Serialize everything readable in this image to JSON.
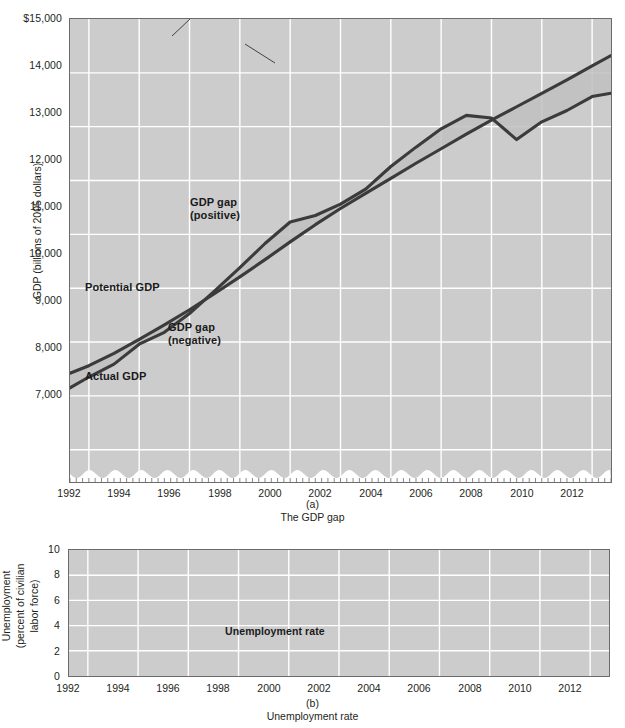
{
  "figure": {
    "panels": [
      {
        "id": "a",
        "caption_letter": "(a)",
        "caption_title": "The GDP gap"
      },
      {
        "id": "b",
        "caption_letter": "(b)",
        "caption_title": "Unemployment rate"
      }
    ]
  },
  "chart_data": [
    {
      "type": "area",
      "id": "panel-a",
      "title": "The GDP gap",
      "subtitle": "(a)",
      "xlabel": "",
      "ylabel": "GDP (billions of 2005 dollars)",
      "xlim": [
        1991.25,
        2012.75
      ],
      "ylim": [
        6400,
        15000
      ],
      "y_axis_break": true,
      "grid": true,
      "grid_color": "#ffffff",
      "plot_background": "#cccccc",
      "line_color": "#3b3b3b",
      "gap_fill_color": "#bfbfbf",
      "xticks": [
        1992,
        1994,
        1996,
        1998,
        2000,
        2002,
        2004,
        2006,
        2008,
        2010,
        2012
      ],
      "xtick_labels": [
        "1992",
        "1994",
        "1996",
        "1998",
        "2000",
        "2002",
        "2004",
        "2006",
        "2008",
        "2010",
        "2012"
      ],
      "yticks": [
        7000,
        8000,
        9000,
        10000,
        11000,
        12000,
        13000,
        14000,
        15000
      ],
      "ytick_labels": [
        "7,000",
        "8,000",
        "9,000",
        "10,000",
        "11,000",
        "12,000",
        "13,000",
        "14,000",
        "$15,000"
      ],
      "annotations": [
        {
          "text_line1": "GDP gap",
          "text_line2": "(positive)",
          "x": 1998.2,
          "y": 11600
        },
        {
          "text_line1": "Potential GDP",
          "text_line2": "",
          "x": 1992.6,
          "y": 9750
        },
        {
          "text_line1": "GDP gap",
          "text_line2": "(negative)",
          "x": 1995.4,
          "y": 9100
        },
        {
          "text_line1": "Actual GDP",
          "text_line2": "",
          "x": 1992.2,
          "y": 8050
        }
      ],
      "series": [
        {
          "name": "Potential GDP",
          "x": [
            1991.25,
            1992,
            1993,
            1994,
            1995,
            1996,
            1997,
            1998,
            1999,
            2000,
            2001,
            2002,
            2003,
            2004,
            2005,
            2006,
            2007,
            2008,
            2009,
            2010,
            2011,
            2012,
            2012.75
          ],
          "values": [
            8420,
            8560,
            8790,
            9050,
            9320,
            9600,
            9900,
            10210,
            10530,
            10860,
            11180,
            11480,
            11760,
            12040,
            12320,
            12590,
            12860,
            13120,
            13370,
            13620,
            13870,
            14130,
            14320
          ]
        },
        {
          "name": "Actual GDP",
          "x": [
            1991.25,
            1992,
            1993,
            1994,
            1995,
            1996,
            1997,
            1998,
            1999,
            2000,
            2001,
            2002,
            2003,
            2004,
            2005,
            2006,
            2007,
            2008,
            2009,
            2010,
            2011,
            2012,
            2012.75
          ],
          "values": [
            8150,
            8350,
            8590,
            8960,
            9180,
            9530,
            9950,
            10380,
            10830,
            11230,
            11350,
            11560,
            11840,
            12260,
            12620,
            12960,
            13210,
            13160,
            12760,
            13090,
            13300,
            13560,
            13620
          ]
        }
      ]
    },
    {
      "type": "line",
      "id": "panel-b",
      "title": "Unemployment rate",
      "subtitle": "(b)",
      "xlabel": "",
      "ylabel": "Unemployment (percent of civilian labor force)",
      "xlim": [
        1991.25,
        2012.75
      ],
      "ylim": [
        0,
        10
      ],
      "grid": true,
      "grid_color": "#ffffff",
      "plot_background": "#cccccc",
      "line_color": "#3b3b3b",
      "xticks": [
        1992,
        1994,
        1996,
        1998,
        2000,
        2002,
        2004,
        2006,
        2008,
        2010,
        2012
      ],
      "xtick_labels": [
        "1992",
        "1994",
        "1996",
        "1998",
        "2000",
        "2002",
        "2004",
        "2006",
        "2008",
        "2010",
        "2012"
      ],
      "yticks": [
        0,
        2,
        4,
        6,
        8,
        10
      ],
      "ytick_labels": [
        "0",
        "2",
        "4",
        "6",
        "8",
        "10"
      ],
      "annotations": [
        {
          "text_line1": "Unemployment rate",
          "text_line2": "",
          "x": 1998.6,
          "y": 3.35
        }
      ],
      "series": [
        {
          "name": "Unemployment rate",
          "x": [
            1991.25,
            1991.75,
            1992.25,
            1992.75,
            1993.25,
            1993.75,
            1994.25,
            1994.75,
            1995.25,
            1995.75,
            1996.25,
            1996.75,
            1997.25,
            1997.75,
            1998.25,
            1998.75,
            1999.25,
            1999.75,
            2000.25,
            2000.75,
            2001.25,
            2001.75,
            2002.25,
            2002.75,
            2003.25,
            2003.75,
            2004.25,
            2004.75,
            2005.25,
            2005.75,
            2006.25,
            2006.75,
            2007.25,
            2007.75,
            2008.25,
            2008.75,
            2009.25,
            2009.75,
            2010.25,
            2010.75,
            2011.25,
            2011.75,
            2012.25,
            2012.75
          ],
          "values": [
            7.5,
            7.7,
            7.6,
            7.3,
            7.1,
            6.7,
            6.5,
            6.0,
            5.6,
            5.7,
            5.5,
            5.3,
            5.1,
            4.9,
            4.6,
            4.4,
            4.3,
            4.2,
            4.0,
            3.9,
            4.4,
            5.4,
            5.8,
            5.7,
            5.9,
            6.1,
            5.8,
            5.6,
            5.3,
            5.1,
            4.8,
            4.6,
            4.5,
            4.7,
            5.3,
            6.3,
            8.3,
            9.5,
            9.9,
            9.6,
            9.1,
            8.9,
            8.2,
            7.6
          ]
        }
      ]
    }
  ]
}
